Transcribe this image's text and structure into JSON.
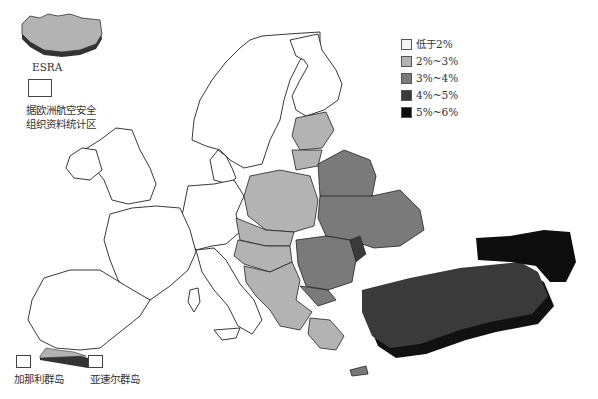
{
  "map": {
    "type": "choropleth",
    "region": "Europe",
    "legend": {
      "items": [
        {
          "label": "低于2%",
          "color": "#f4f4f4"
        },
        {
          "label": "2%~3%",
          "color": "#b3b3b3"
        },
        {
          "label": "3%~4%",
          "color": "#7a7a7a"
        },
        {
          "label": "4%~5%",
          "color": "#3a3a3a"
        },
        {
          "label": "5%~6%",
          "color": "#0d0d0d"
        }
      ]
    },
    "annotations": {
      "esra_label": "ESRA",
      "esra_box_label_line1": "据欧洲航空安全",
      "esra_box_label_line2": "组织资料统计区",
      "canary_islands": "加那利群岛",
      "azores": "亚速尔群岛"
    },
    "regions": [
      {
        "name": "Iceland",
        "class": "2%~3%"
      },
      {
        "name": "Western & Northern Europe",
        "class": "低于2%"
      },
      {
        "name": "Baltic States",
        "class": "2%~3%"
      },
      {
        "name": "Poland",
        "class": "2%~3%"
      },
      {
        "name": "Central Europe & Balkans",
        "class": "2%~3%"
      },
      {
        "name": "Belarus",
        "class": "3%~4%"
      },
      {
        "name": "Ukraine",
        "class": "3%~4%"
      },
      {
        "name": "Romania",
        "class": "3%~4%"
      },
      {
        "name": "Moldova",
        "class": "4%~5%"
      },
      {
        "name": "Turkey",
        "class": "4%~5%"
      },
      {
        "name": "Caucasus",
        "class": "5%~6%"
      },
      {
        "name": "Greece",
        "class": "2%~3%"
      },
      {
        "name": "Cyprus",
        "class": "3%~4%"
      }
    ]
  }
}
